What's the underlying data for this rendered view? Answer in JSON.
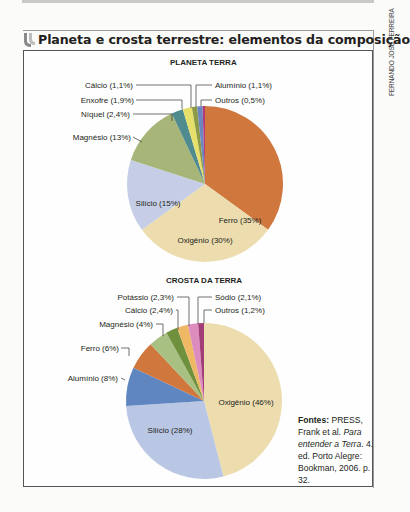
{
  "title": "Planeta e crosta terrestre: elementos da composição",
  "credit": "FERNANDO JOSÉ FERREIRA",
  "source": {
    "label": "Fontes:",
    "text1": "PRESS, Frank et al.",
    "book": "Para entender a Terra",
    "text2": ". 4. ed. Porto Alegre: Bookman, 2006. p. 32."
  },
  "chart_data": [
    {
      "type": "pie",
      "title": "PLANETA TERRA",
      "start_angle": "12 o'clock, clockwise",
      "categories": [
        "Ferro",
        "Oxigênio",
        "Silício",
        "Magnésio",
        "Níquel",
        "Enxofre",
        "Cálcio",
        "Alumínio",
        "Outros"
      ],
      "values": [
        35,
        30,
        15,
        13,
        2.4,
        1.9,
        1.1,
        1.1,
        0.5
      ],
      "labels": [
        "Ferro (35%)",
        "Oxigênio (30%)",
        "Silício (15%)",
        "Magnésio (13%)",
        "Níquel (2,4%)",
        "Enxofre (1,9%)",
        "Cálcio (1,1%)",
        "Alumínio (1,1%)",
        "Outros (0,5%)"
      ],
      "colors": [
        "#d0773e",
        "#ecdcae",
        "#c5cee6",
        "#a7b678",
        "#4f8b8f",
        "#e6df6c",
        "#8c9a45",
        "#6c86c0",
        "#b23b7e"
      ],
      "unit": "%"
    },
    {
      "type": "pie",
      "title": "CROSTA DA TERRA",
      "start_angle": "12 o'clock, clockwise",
      "categories": [
        "Oxigênio",
        "Silício",
        "Alumínio",
        "Ferro",
        "Magnésio",
        "Cálcio",
        "Potássio",
        "Sódio",
        "Outros"
      ],
      "values": [
        46,
        28,
        8,
        6,
        4,
        2.4,
        2.3,
        2.1,
        1.2
      ],
      "labels": [
        "Oxigênio (46%)",
        "Silício (28%)",
        "Alumínio (8%)",
        "Ferro (6%)",
        "Magnésio (4%)",
        "Cálcio (2,4%)",
        "Potássio (2,3%)",
        "Sódio (2,1%)",
        "Outros (1,2%)"
      ],
      "colors": [
        "#ecdcae",
        "#b9c6e4",
        "#5f86c0",
        "#d0773e",
        "#a9c083",
        "#6f913e",
        "#eeb864",
        "#dd8cc0",
        "#a23d78"
      ],
      "unit": "%"
    }
  ]
}
